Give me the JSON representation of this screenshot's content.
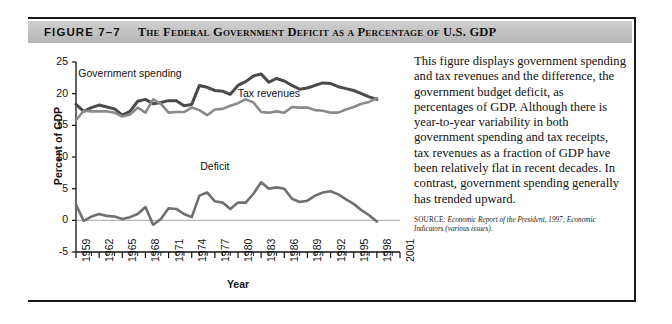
{
  "figure": {
    "number": "FIGURE 7–7",
    "title": "The Federal Government Deficit as a Percentage of U.S. GDP"
  },
  "caption": {
    "body": "This figure displays government spending and tax revenues and the difference, the government budget deficit, as percentages of GDP. Although there is year-to-year variability in both government spending and tax receipts, tax revenues as a fraction of GDP have been relatively flat in recent decades. In contrast, government spending generally has trended upward.",
    "source_label": "SOURCE:",
    "source_text": "Economic Report of the President, 1997; Economic Indicators (various issues)."
  },
  "chart_data": {
    "type": "line",
    "title": "",
    "xlabel": "Year",
    "ylabel": "Percent of GDP",
    "xlim": [
      1959,
      2001
    ],
    "ylim": [
      -5,
      25
    ],
    "yticks": [
      25,
      20,
      15,
      10,
      5,
      0,
      -5
    ],
    "xticks": [
      1959,
      1962,
      1965,
      1968,
      1971,
      1974,
      1977,
      1980,
      1983,
      1986,
      1989,
      1992,
      1995,
      1998,
      2001
    ],
    "grid": false,
    "legend": "inline-annotations",
    "annotations": [
      {
        "text": "Government spending",
        "x": 1966.0,
        "y": 22.6
      },
      {
        "text": "Tax revenues",
        "x": 1984.0,
        "y": 19.4
      },
      {
        "text": "Deficit",
        "x": 1977.0,
        "y": 8.0
      }
    ],
    "colors": {
      "government_spending": "#4a4a4a",
      "tax_revenues": "#8a8a8a",
      "deficit": "#6f6f6f",
      "axis": "#111111"
    },
    "x": [
      1959,
      1960,
      1961,
      1962,
      1963,
      1964,
      1965,
      1966,
      1967,
      1968,
      1969,
      1970,
      1971,
      1972,
      1973,
      1974,
      1975,
      1976,
      1977,
      1978,
      1979,
      1980,
      1981,
      1982,
      1983,
      1984,
      1985,
      1986,
      1987,
      1988,
      1989,
      1990,
      1991,
      1992,
      1993,
      1994,
      1995,
      1996,
      1997,
      1998
    ],
    "series": [
      {
        "name": "Government spending",
        "values": [
          18.3,
          17.2,
          17.8,
          18.2,
          17.9,
          17.6,
          16.6,
          17.2,
          18.8,
          19.1,
          18.4,
          18.6,
          18.9,
          18.9,
          18.1,
          18.3,
          21.3,
          21.0,
          20.5,
          20.4,
          19.9,
          21.3,
          21.9,
          22.8,
          23.1,
          21.8,
          22.4,
          22.0,
          21.3,
          20.7,
          20.9,
          21.3,
          21.7,
          21.6,
          21.1,
          20.8,
          20.5,
          20.0,
          19.5,
          19.1
        ]
      },
      {
        "name": "Tax revenues",
        "values": [
          15.8,
          17.3,
          17.2,
          17.2,
          17.2,
          17.0,
          16.4,
          16.7,
          17.8,
          17.0,
          19.1,
          18.4,
          17.0,
          17.1,
          17.1,
          17.8,
          17.4,
          16.6,
          17.5,
          17.6,
          18.1,
          18.5,
          19.1,
          18.6,
          17.1,
          17.0,
          17.2,
          17.0,
          17.9,
          17.8,
          17.8,
          17.4,
          17.3,
          17.0,
          17.0,
          17.5,
          17.9,
          18.4,
          18.7,
          19.3
        ]
      },
      {
        "name": "Deficit",
        "values": [
          2.5,
          -0.1,
          0.6,
          1.0,
          0.7,
          0.6,
          0.2,
          0.5,
          1.0,
          2.1,
          -0.7,
          0.2,
          1.9,
          1.8,
          1.0,
          0.5,
          3.9,
          4.4,
          3.0,
          2.8,
          1.8,
          2.8,
          2.8,
          4.2,
          6.0,
          5.0,
          5.2,
          5.0,
          3.4,
          2.9,
          3.1,
          3.9,
          4.4,
          4.6,
          4.1,
          3.3,
          2.6,
          1.6,
          0.8,
          -0.2
        ]
      }
    ]
  }
}
